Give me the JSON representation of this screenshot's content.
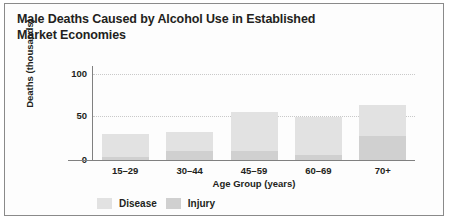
{
  "chart_data": {
    "type": "bar",
    "title": "Male Deaths Caused by Alcohol Use in Established Market Economies",
    "title_line1": "Male Deaths Caused by Alcohol Use in Established",
    "title_line2": "Market Economies",
    "xlabel": "Age Group (years)",
    "ylabel": "Deaths (thousands)",
    "categories": [
      "15–29",
      "30–44",
      "45–59",
      "60–69",
      "70+"
    ],
    "ylim": [
      0,
      110
    ],
    "yticks": [
      "0",
      "50",
      "100"
    ],
    "ytick_values": [
      0,
      50,
      100
    ],
    "grid": "horizontal-dotted",
    "stacked": true,
    "legend_position": "bottom-left",
    "series": [
      {
        "name": "Disease",
        "color": "#e2e2e2",
        "values": [
          26,
          22,
          45,
          44,
          36
        ]
      },
      {
        "name": "Injury",
        "color": "#d0d0d0",
        "values": [
          4,
          11,
          11,
          6,
          28
        ]
      }
    ],
    "totals": [
      30,
      33,
      56,
      50,
      64
    ]
  },
  "legend": {
    "items": [
      {
        "label": "Disease",
        "swatch": "disease-swatch"
      },
      {
        "label": "Injury",
        "swatch": "injury-swatch"
      }
    ]
  }
}
